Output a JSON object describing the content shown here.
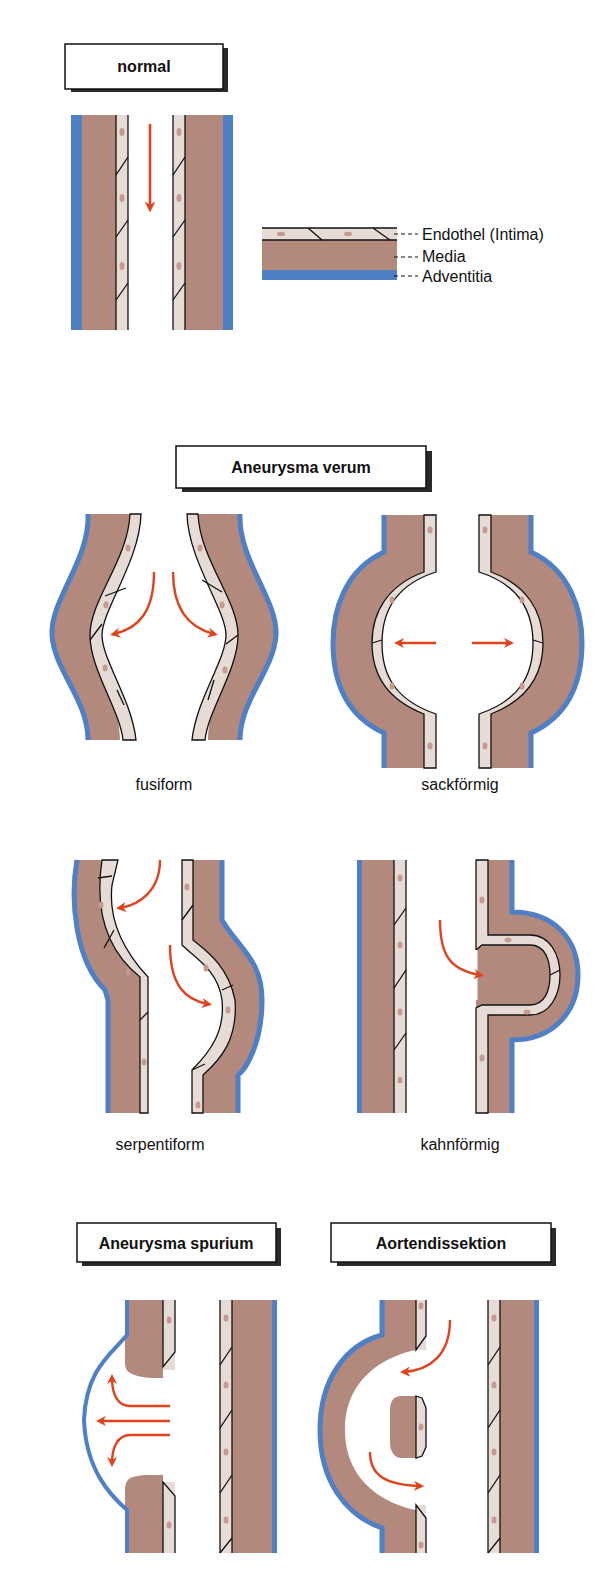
{
  "colors": {
    "adventitia": "#4f7fc4",
    "media": "#b2897c",
    "intima": "#e6dbd5",
    "nucleus": "#c59a90",
    "arrow": "#e0421c",
    "outline": "#111111"
  },
  "sections": {
    "normal": {
      "title": "normal",
      "legend": [
        {
          "label": "Endothel (Intima)",
          "layer": "intima"
        },
        {
          "label": "Media",
          "layer": "media"
        },
        {
          "label": "Adventitia",
          "layer": "adventitia"
        }
      ]
    },
    "verum": {
      "title": "Aneurysma verum",
      "types": [
        {
          "label": "fusiform"
        },
        {
          "label": "sackförmig"
        },
        {
          "label": "serpentiform"
        },
        {
          "label": "kahnförmig"
        }
      ]
    },
    "spurium": {
      "title": "Aneurysma spurium"
    },
    "dissektion": {
      "title": "Aortendissektion"
    }
  }
}
